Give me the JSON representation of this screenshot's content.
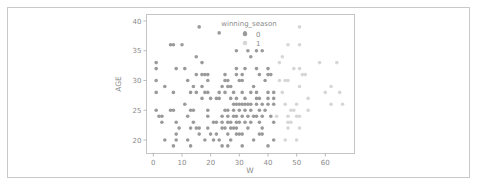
{
  "chart_data": {
    "type": "scatter",
    "title": "",
    "xlabel": "W",
    "ylabel": "AGE",
    "xlim": [
      -2,
      68
    ],
    "ylim": [
      18,
      41
    ],
    "xticks": [
      0,
      10,
      20,
      30,
      40,
      50,
      60
    ],
    "yticks": [
      20,
      25,
      30,
      35,
      40
    ],
    "grid": false,
    "legend": {
      "title": "winning_season",
      "position": "upper center",
      "entries": [
        {
          "label": "0",
          "color": "#9a9a9a"
        },
        {
          "label": "1",
          "color": "#d6d6d6"
        }
      ]
    },
    "series": [
      {
        "name": "0",
        "color": "#9a9a9a",
        "points": [
          [
            16,
            39
          ],
          [
            23,
            38
          ],
          [
            32,
            38
          ],
          [
            6,
            36
          ],
          [
            7,
            36
          ],
          [
            10,
            36
          ],
          [
            29,
            35
          ],
          [
            33,
            35
          ],
          [
            36,
            35
          ],
          [
            38,
            35
          ],
          [
            34,
            34
          ],
          [
            15,
            34
          ],
          [
            1,
            33
          ],
          [
            17,
            33
          ],
          [
            1,
            32
          ],
          [
            8,
            32
          ],
          [
            11,
            32
          ],
          [
            29,
            32
          ],
          [
            32,
            32
          ],
          [
            36,
            32
          ],
          [
            40,
            32
          ],
          [
            15,
            31
          ],
          [
            17,
            31
          ],
          [
            18,
            31
          ],
          [
            19,
            31
          ],
          [
            25,
            31
          ],
          [
            29,
            31
          ],
          [
            31,
            31
          ],
          [
            37,
            31
          ],
          [
            40,
            31
          ],
          [
            41,
            31
          ],
          [
            1,
            30
          ],
          [
            12,
            30
          ],
          [
            19,
            30
          ],
          [
            25,
            30
          ],
          [
            26,
            30
          ],
          [
            30,
            30
          ],
          [
            31,
            30
          ],
          [
            39,
            30
          ],
          [
            4,
            29
          ],
          [
            14,
            29
          ],
          [
            17,
            29
          ],
          [
            24,
            29
          ],
          [
            26,
            29
          ],
          [
            27,
            29
          ],
          [
            35,
            29
          ],
          [
            1,
            28
          ],
          [
            7,
            28
          ],
          [
            13,
            28
          ],
          [
            15,
            28
          ],
          [
            18,
            28
          ],
          [
            19,
            28
          ],
          [
            23,
            28
          ],
          [
            25,
            28
          ],
          [
            28,
            28
          ],
          [
            31,
            28
          ],
          [
            34,
            28
          ],
          [
            36,
            28
          ],
          [
            40,
            28
          ],
          [
            42,
            28
          ],
          [
            17,
            27
          ],
          [
            20,
            27
          ],
          [
            22,
            27
          ],
          [
            23,
            27
          ],
          [
            27,
            27
          ],
          [
            29,
            27
          ],
          [
            32,
            27
          ],
          [
            36,
            27
          ],
          [
            37,
            27
          ],
          [
            40,
            27
          ],
          [
            42,
            27
          ],
          [
            11,
            26
          ],
          [
            28,
            26
          ],
          [
            29,
            26
          ],
          [
            30,
            26
          ],
          [
            31,
            26
          ],
          [
            32,
            26
          ],
          [
            33,
            26
          ],
          [
            34,
            26
          ],
          [
            36,
            26
          ],
          [
            38,
            26
          ],
          [
            40,
            26
          ],
          [
            42,
            26
          ],
          [
            1,
            25
          ],
          [
            6,
            25
          ],
          [
            7,
            25
          ],
          [
            13,
            25
          ],
          [
            14,
            25
          ],
          [
            19,
            25
          ],
          [
            25,
            25
          ],
          [
            26,
            25
          ],
          [
            28,
            25
          ],
          [
            30,
            25
          ],
          [
            32,
            25
          ],
          [
            34,
            25
          ],
          [
            37,
            25
          ],
          [
            39,
            25
          ],
          [
            2,
            24
          ],
          [
            3,
            24
          ],
          [
            12,
            24
          ],
          [
            19,
            24
          ],
          [
            24,
            24
          ],
          [
            26,
            24
          ],
          [
            28,
            24
          ],
          [
            29,
            24
          ],
          [
            31,
            24
          ],
          [
            33,
            24
          ],
          [
            35,
            24
          ],
          [
            36,
            24
          ],
          [
            38,
            24
          ],
          [
            41,
            24
          ],
          [
            3,
            23
          ],
          [
            8,
            23
          ],
          [
            14,
            23
          ],
          [
            21,
            23
          ],
          [
            22,
            23
          ],
          [
            24,
            23
          ],
          [
            26,
            23
          ],
          [
            27,
            23
          ],
          [
            29,
            23
          ],
          [
            30,
            23
          ],
          [
            32,
            23
          ],
          [
            34,
            23
          ],
          [
            37,
            23
          ],
          [
            42,
            23
          ],
          [
            9,
            22
          ],
          [
            13,
            22
          ],
          [
            15,
            22
          ],
          [
            16,
            22
          ],
          [
            19,
            22
          ],
          [
            24,
            22
          ],
          [
            25,
            22
          ],
          [
            27,
            22
          ],
          [
            28,
            22
          ],
          [
            29,
            22
          ],
          [
            33,
            22
          ],
          [
            38,
            22
          ],
          [
            8,
            21
          ],
          [
            16,
            21
          ],
          [
            20,
            21
          ],
          [
            22,
            21
          ],
          [
            26,
            21
          ],
          [
            29,
            21
          ],
          [
            30,
            21
          ],
          [
            31,
            21
          ],
          [
            37,
            21
          ],
          [
            38,
            21
          ],
          [
            4,
            20
          ],
          [
            8,
            20
          ],
          [
            12,
            20
          ],
          [
            18,
            20
          ],
          [
            21,
            20
          ],
          [
            23,
            20
          ],
          [
            27,
            20
          ],
          [
            35,
            20
          ],
          [
            42,
            20
          ],
          [
            7,
            19
          ],
          [
            13,
            19
          ],
          [
            24,
            19
          ],
          [
            26,
            19
          ],
          [
            31,
            19
          ],
          [
            40,
            19
          ]
        ]
      },
      {
        "name": "1",
        "color": "#d6d6d6",
        "points": [
          [
            51,
            39
          ],
          [
            47,
            36
          ],
          [
            51,
            36
          ],
          [
            45,
            34
          ],
          [
            44,
            33
          ],
          [
            58,
            33
          ],
          [
            64,
            33
          ],
          [
            49,
            32
          ],
          [
            51,
            32
          ],
          [
            52,
            31
          ],
          [
            53,
            31
          ],
          [
            44,
            30
          ],
          [
            46,
            30
          ],
          [
            47,
            30
          ],
          [
            51,
            29
          ],
          [
            62,
            29
          ],
          [
            60,
            28
          ],
          [
            65,
            28
          ],
          [
            45,
            28
          ],
          [
            54,
            27
          ],
          [
            46,
            26
          ],
          [
            50,
            26
          ],
          [
            62,
            26
          ],
          [
            66,
            26
          ],
          [
            48,
            25
          ],
          [
            49,
            25
          ],
          [
            54,
            25
          ],
          [
            43,
            24
          ],
          [
            47,
            24
          ],
          [
            50,
            24
          ],
          [
            51,
            24
          ],
          [
            47,
            23
          ],
          [
            48,
            23
          ],
          [
            47,
            22
          ],
          [
            51,
            22
          ],
          [
            46,
            20
          ],
          [
            50,
            20
          ]
        ]
      }
    ]
  }
}
